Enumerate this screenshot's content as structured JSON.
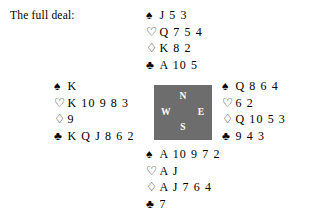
{
  "caption": "The full deal:",
  "suits": {
    "spade": "♠",
    "heart": "♡",
    "diamond": "♢",
    "club": "♣"
  },
  "compass": {
    "north": "N",
    "west": "W",
    "east": "E",
    "south": "S",
    "box_color": "#6d6d6d",
    "label_color": "#ffffff"
  },
  "hands": {
    "north": {
      "position": "North",
      "spades": "J 5 3",
      "hearts": "Q 7 5 4",
      "diamonds": "K 8 2",
      "clubs": "A 10 5"
    },
    "west": {
      "position": "West",
      "spades": "K",
      "hearts": "K 10 9 8 3",
      "diamonds": "9",
      "clubs": "K Q J 8 6 2"
    },
    "east": {
      "position": "East",
      "spades": "Q 8 6 4",
      "hearts": "6 2",
      "diamonds": "Q 10 5 3",
      "clubs": "9 4 3"
    },
    "south": {
      "position": "South",
      "spades": "A 10 9 7 2",
      "hearts": "A J",
      "diamonds": "A J 7 6 4",
      "clubs": "7"
    }
  }
}
